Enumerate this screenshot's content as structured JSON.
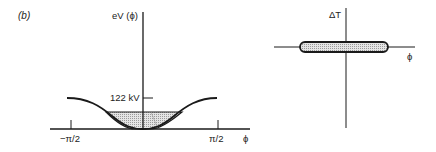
{
  "panel_label": "(b)",
  "left_plot": {
    "y_axis_label": "eV (ϕ)",
    "x_axis_label": "ϕ",
    "x_ticks": [
      "−π/2",
      "π/2"
    ],
    "level_label": "122 kV",
    "curve_description": "potential well, cosine-shaped, minimum at ϕ = 0",
    "shaded_region": "bucket area below stable level"
  },
  "right_plot": {
    "y_axis_label": "ΔT",
    "x_axis_label": "ϕ",
    "shape": "flat elongated ellipse (phase space)"
  },
  "colors": {
    "ink": "#1a1a1a",
    "fill": "#c8c8c8"
  }
}
